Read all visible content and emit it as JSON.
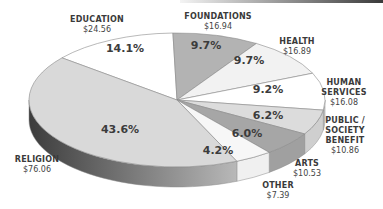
{
  "chart_data": {
    "type": "pie",
    "style": "3d-exploded-ellipse",
    "title": "",
    "categories": [
      "Religion",
      "Education",
      "Foundations",
      "Health",
      "Human Services",
      "Public / Society Benefit",
      "Arts",
      "Other"
    ],
    "values": [
      76.06,
      24.56,
      16.94,
      16.89,
      16.08,
      10.86,
      10.53,
      7.39
    ],
    "percentages": [
      43.6,
      14.1,
      9.7,
      9.7,
      9.2,
      6.2,
      6.0,
      4.2
    ],
    "value_labels": [
      "$76.06",
      "$24.56",
      "$16.94",
      "$16.89",
      "$16.08",
      "$10.86",
      "$10.53",
      "$7.39"
    ],
    "percent_labels": [
      "43.6%",
      "14.1%",
      "9.7%",
      "9.7%",
      "9.2%",
      "6.2%",
      "6.0%",
      "4.2%"
    ],
    "colors": [
      "#d9d9d9",
      "#ffffff",
      "#b3b3b3",
      "#f2f2f2",
      "#ffffff",
      "#dcdcdc",
      "#a6a6a6",
      "#f7f7f7"
    ],
    "legend": "none (direct labels)"
  },
  "labels": {
    "religion": {
      "name": "RELIGION",
      "value": "$76.06"
    },
    "education": {
      "name": "EDUCATION",
      "value": "$24.56"
    },
    "foundations": {
      "name": "FOUNDATIONS",
      "value": "$16.94"
    },
    "health": {
      "name": "HEALTH",
      "value": "$16.89"
    },
    "human_services": {
      "name1": "HUMAN",
      "name2": "SERVICES",
      "value": "$16.08"
    },
    "public_society": {
      "name1": "PUBLIC /",
      "name2": "SOCIETY BENEFIT",
      "value": "$10.86"
    },
    "arts": {
      "name": "ARTS",
      "value": "$10.53"
    },
    "other": {
      "name": "OTHER",
      "value": "$7.39"
    }
  }
}
